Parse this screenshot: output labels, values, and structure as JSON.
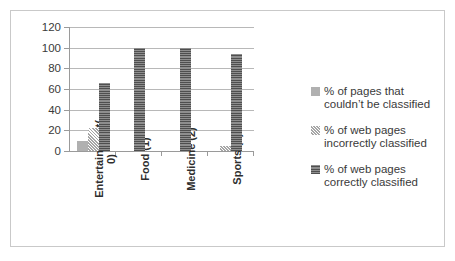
{
  "chart_data": {
    "type": "bar",
    "title": "",
    "subtitle": "",
    "xlabel": "",
    "ylabel": "",
    "ylim": [
      0,
      120
    ],
    "yticks": [
      0,
      20,
      40,
      60,
      80,
      100,
      120
    ],
    "grid": true,
    "legend_position": "right",
    "orientation": "vertical",
    "grouping": "grouped",
    "xtick_rotation": 90,
    "categories": [
      "Entertainment(0)",
      "Food (1)",
      "Medicine (2)",
      "Sports (3)"
    ],
    "category_lines": [
      [
        "Entertainment(",
        "0)"
      ],
      [
        "Food (1)"
      ],
      [
        "Medicine (2)"
      ],
      [
        "Sports (3)"
      ]
    ],
    "series": [
      {
        "name": "% of pages that couldn't be classified",
        "name_lines": [
          "% of pages that",
          "couldn’t be classified"
        ],
        "pattern": "solid-light-gray",
        "color": "#b0b0b0",
        "values": [
          10,
          0,
          0,
          0
        ]
      },
      {
        "name": "% of web pages incorrectly classified",
        "name_lines": [
          "% of web pages",
          "incorrectly classified"
        ],
        "pattern": "diagonal-hatch",
        "color": "#a6a6a6",
        "values": [
          22,
          0,
          0,
          5
        ]
      },
      {
        "name": "% of web pages correctly classified",
        "name_lines": [
          "% of web pages",
          "correctly classified"
        ],
        "pattern": "dense-horizontal-hatch",
        "color": "#5e5e5e",
        "values": [
          66,
          100,
          100,
          94
        ]
      }
    ]
  },
  "axes": {
    "y_tick_labels": [
      "120",
      "100",
      "80",
      "60",
      "40",
      "20",
      "0"
    ]
  },
  "legend": {
    "items": [
      {
        "line1": "% of pages that",
        "line2": "couldn’t be classified"
      },
      {
        "line1": "% of web pages",
        "line2": "incorrectly classified"
      },
      {
        "line1": "% of web pages",
        "line2": "correctly classified"
      }
    ]
  },
  "style": {
    "border_color": "#c9c9c9",
    "gridline_color": "#b8b8b8",
    "axis_color": "#9a9a9a",
    "text_color": "#3a3a3a",
    "background": "#ffffff"
  }
}
